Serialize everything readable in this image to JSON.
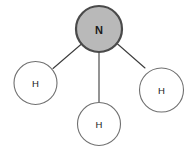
{
  "diagram": {
    "background_color": "#ffffff",
    "central_atom": {
      "label": "N",
      "name": "nitrogen",
      "cx": 99,
      "cy": 29,
      "r": 23,
      "fill_color": "#b9b9b9",
      "stroke_color": "#4a4a4a",
      "stroke_width": 2.2
    },
    "outer_atoms": [
      {
        "label": "H",
        "name": "hydrogen-left",
        "cx": 35.5,
        "cy": 83,
        "r": 21.5,
        "fill_color": "#ffffff",
        "stroke_color": "#707070",
        "stroke_width": 1.1
      },
      {
        "label": "H",
        "name": "hydrogen-bottom",
        "cx": 99,
        "cy": 124,
        "r": 21.5,
        "fill_color": "#ffffff",
        "stroke_color": "#707070",
        "stroke_width": 1.1
      },
      {
        "label": "H",
        "name": "hydrogen-right",
        "cx": 161.5,
        "cy": 90,
        "r": 22,
        "fill_color": "#ffffff",
        "stroke_color": "#707070",
        "stroke_width": 1.1
      }
    ],
    "bonds": [
      {
        "name": "bond-nitrogen-hydrogen-left",
        "from": "N",
        "to": "H",
        "x1": 81.5,
        "y1": 44.0,
        "x2": 53.0,
        "y2": 68.5,
        "stroke_color": "#3c3c3c",
        "stroke_width": 1.1
      },
      {
        "name": "bond-nitrogen-hydrogen-bottom",
        "from": "N",
        "to": "H",
        "x1": 99.0,
        "y1": 52.0,
        "x2": 99.0,
        "y2": 102.5,
        "stroke_color": "#3c3c3c",
        "stroke_width": 1.1
      },
      {
        "name": "bond-nitrogen-hydrogen-right",
        "from": "N",
        "to": "H",
        "x1": 117.0,
        "y1": 43.5,
        "x2": 145.0,
        "y2": 68.0,
        "stroke_color": "#3c3c3c",
        "stroke_width": 1.1
      }
    ]
  }
}
